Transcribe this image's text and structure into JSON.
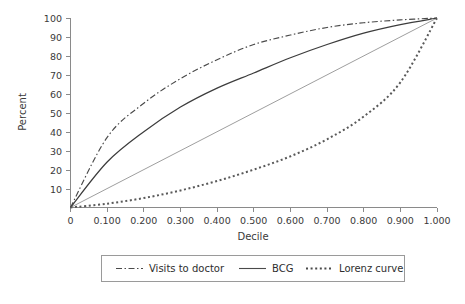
{
  "chart_data": {
    "type": "line",
    "title": "",
    "xlabel": "Decile",
    "ylabel": "Percent",
    "xlim": [
      0,
      1.0
    ],
    "ylim": [
      0,
      100
    ],
    "grid": false,
    "legend_position": "bottom",
    "x": [
      0,
      0.1,
      0.2,
      0.3,
      0.4,
      0.5,
      0.6,
      0.7,
      0.8,
      0.9,
      1.0
    ],
    "xticklabels": [
      "0",
      "0.100",
      "0.200",
      "0.300",
      "0.400",
      "0.500",
      "0.600",
      "0.700",
      "0.800",
      "0.900",
      "1.000"
    ],
    "yticklabels": [
      "10",
      "20",
      "30",
      "40",
      "50",
      "60",
      "70",
      "80",
      "90",
      "100"
    ],
    "yticks": [
      10,
      20,
      30,
      40,
      50,
      60,
      70,
      80,
      90,
      100
    ],
    "series": [
      {
        "name": "Visits to doctor",
        "style": "dash-dot",
        "color": "#4a4a4a",
        "values": [
          0,
          37,
          55,
          68,
          78,
          86,
          91,
          95,
          97.5,
          99,
          100
        ]
      },
      {
        "name": "BCG",
        "style": "solid",
        "color": "#3c3c3c",
        "values": [
          0,
          24,
          40,
          53,
          63,
          71,
          79,
          86,
          92,
          96.5,
          100
        ]
      },
      {
        "name": "Equality line",
        "style": "thin-solid",
        "color": "#8c8c8c",
        "values": [
          0,
          10,
          20,
          30,
          40,
          50,
          60,
          70,
          80,
          90,
          100
        ],
        "in_legend": false
      },
      {
        "name": "Lorenz curve",
        "style": "dotted",
        "color": "#595959",
        "values": [
          0,
          2,
          5,
          9,
          14,
          20,
          27,
          36,
          48,
          66,
          100
        ]
      }
    ]
  },
  "axes": {
    "ylabel": "Percent",
    "xlabel": "Decile",
    "yticklabels": [
      "100",
      "90",
      "80",
      "70",
      "60",
      "50",
      "40",
      "30",
      "20",
      "10"
    ],
    "xticklabels": [
      "0",
      "0.100",
      "0.200",
      "0.300",
      "0.400",
      "0.500",
      "0.600",
      "0.700",
      "0.800",
      "0.900",
      "1.000"
    ]
  },
  "legend": {
    "items": [
      {
        "label": "Visits to doctor",
        "style": "dash-dot"
      },
      {
        "label": "BCG",
        "style": "solid"
      },
      {
        "label": "Lorenz curve",
        "style": "dotted"
      }
    ]
  },
  "caption": {
    "text": ""
  }
}
